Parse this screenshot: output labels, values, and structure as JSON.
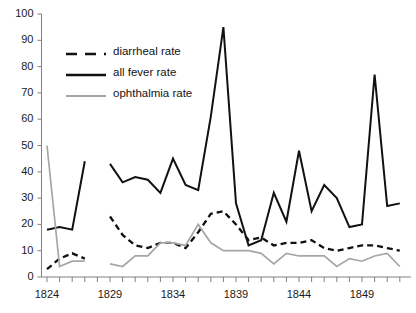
{
  "chart_data": {
    "type": "line",
    "title": "",
    "xlabel": "",
    "ylabel": "",
    "xlim": [
      1823.5,
      1852.5
    ],
    "ylim": [
      0,
      100
    ],
    "ytick_step": 10,
    "grid": false,
    "legend_position": "upper-left-inside",
    "yticks": [
      "0",
      "10",
      "20",
      "30",
      "40",
      "50",
      "60",
      "70",
      "80",
      "90",
      "100"
    ],
    "xticks_labeled": [
      "1824",
      "1829",
      "1834",
      "1839",
      "1844",
      "1849"
    ],
    "xticks_all": [
      1824,
      1825,
      1826,
      1827,
      1828,
      1829,
      1830,
      1831,
      1832,
      1833,
      1834,
      1835,
      1836,
      1837,
      1838,
      1839,
      1840,
      1841,
      1842,
      1843,
      1844,
      1845,
      1846,
      1847,
      1848,
      1849,
      1850,
      1851,
      1852
    ],
    "colors": {
      "diarrheal": "#111111",
      "all_fever": "#111111",
      "ophthalmia": "#a6a6a6",
      "axis": "#808080",
      "text": "#1a1a1a"
    },
    "series": [
      {
        "name": "diarrheal rate",
        "style": "dashed",
        "color": "#111111",
        "segments": [
          {
            "x": [
              1824,
              1825,
              1826,
              1827
            ],
            "values": [
              3,
              7,
              9,
              7
            ]
          },
          {
            "x": [
              1829,
              1830,
              1831,
              1832,
              1833,
              1834,
              1835,
              1836,
              1837,
              1838,
              1839,
              1840,
              1841,
              1842,
              1843,
              1844,
              1845,
              1846,
              1847,
              1848,
              1849,
              1850,
              1851,
              1852
            ],
            "values": [
              23,
              16,
              12,
              11,
              13,
              13,
              11,
              17,
              24,
              25,
              20,
              14,
              15,
              12,
              13,
              13,
              14,
              11,
              10,
              11,
              12,
              12,
              11,
              10
            ]
          }
        ]
      },
      {
        "name": "all fever rate",
        "style": "solid",
        "color": "#111111",
        "segments": [
          {
            "x": [
              1824,
              1825,
              1826,
              1827
            ],
            "values": [
              18,
              19,
              18,
              44
            ]
          },
          {
            "x": [
              1829,
              1830,
              1831,
              1832,
              1833,
              1834,
              1835,
              1836,
              1837,
              1838,
              1839,
              1840,
              1841,
              1842,
              1843,
              1844,
              1845,
              1846,
              1847,
              1848,
              1849,
              1850,
              1851,
              1852
            ],
            "values": [
              43,
              36,
              38,
              37,
              32,
              45,
              35,
              33,
              61,
              95,
              28,
              12,
              14,
              32,
              21,
              48,
              25,
              35,
              30,
              19,
              20,
              77,
              27,
              28
            ]
          }
        ]
      },
      {
        "name": "ophthalmia rate",
        "style": "solid",
        "color": "#a6a6a6",
        "segments": [
          {
            "x": [
              1824,
              1825,
              1826,
              1827
            ],
            "values": [
              50,
              4,
              6,
              6
            ]
          },
          {
            "x": [
              1829,
              1830,
              1831,
              1832,
              1833,
              1834,
              1835,
              1836,
              1837,
              1838,
              1839,
              1840,
              1841,
              1842,
              1843,
              1844,
              1845,
              1846,
              1847,
              1848,
              1849,
              1850,
              1851,
              1852
            ],
            "values": [
              5,
              4,
              8,
              8,
              13,
              13,
              12,
              20,
              13,
              10,
              10,
              10,
              9,
              5,
              9,
              8,
              8,
              8,
              4,
              7,
              6,
              8,
              9,
              4
            ]
          }
        ]
      }
    ],
    "legend": [
      {
        "label": "diarrheal rate",
        "style": "dashed",
        "color": "#111111"
      },
      {
        "label": "all fever rate",
        "style": "solid",
        "color": "#111111"
      },
      {
        "label": "ophthalmia rate",
        "style": "solid",
        "color": "#a6a6a6"
      }
    ]
  }
}
